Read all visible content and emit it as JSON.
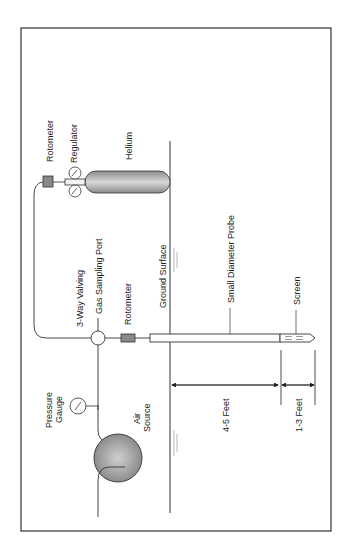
{
  "diagram": {
    "orientation": "rotated 90 degrees counterclockwise",
    "labels": {
      "rotometer_top": "Rotometer",
      "regulator": "Regulator",
      "helium": "Helium",
      "three_way_valving": "3-Way Valving",
      "gas_sampling_port": "Gas Sampling Port",
      "rotometer_mid": "Rotometer",
      "ground_surface": "Ground Surface",
      "small_diameter_probe": "Small Diameter Probe",
      "screen": "Screen",
      "pressure_gauge_line1": "Pressure",
      "pressure_gauge_line2": "Gauge",
      "air_source_line1": "Air",
      "air_source_line2": "Source",
      "depth_upper": "4-5 Feet",
      "depth_lower": "1-3 Feet"
    },
    "colors": {
      "line": "#333333",
      "tank_fill": "#b5b5b5",
      "rotometer_fill": "#888888",
      "frame": "#333333"
    }
  }
}
